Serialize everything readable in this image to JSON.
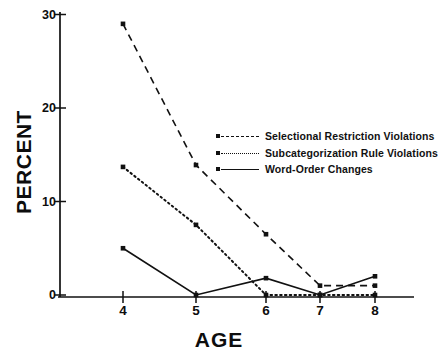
{
  "chart_data": {
    "type": "line",
    "title": "",
    "xlabel": "AGE",
    "ylabel": "PERCENT",
    "x": [
      4,
      5,
      6,
      7,
      8
    ],
    "xtick_labels": [
      "4",
      "5",
      "6",
      "7",
      "8"
    ],
    "ytick_labels": [
      "0",
      "10",
      "20",
      "30"
    ],
    "yticks": [
      0,
      10,
      20,
      30
    ],
    "ylim": [
      0,
      30
    ],
    "xlim": [
      3.4,
      8.7
    ],
    "grid": false,
    "legend_position": "center-right",
    "series": [
      {
        "name": "Selectional Restriction Violations",
        "style": "dashed",
        "marker": "square",
        "color": "#111111",
        "values": [
          29,
          13.9,
          6.5,
          1,
          1
        ]
      },
      {
        "name": "Subcategorization Rule Violations",
        "style": "dotted",
        "marker": "square",
        "color": "#111111",
        "values": [
          13.7,
          7.5,
          0,
          0,
          0
        ]
      },
      {
        "name": "Word-Order Changes",
        "style": "solid",
        "marker": "square",
        "color": "#111111",
        "values": [
          5,
          0,
          1.8,
          0,
          2
        ]
      }
    ]
  }
}
